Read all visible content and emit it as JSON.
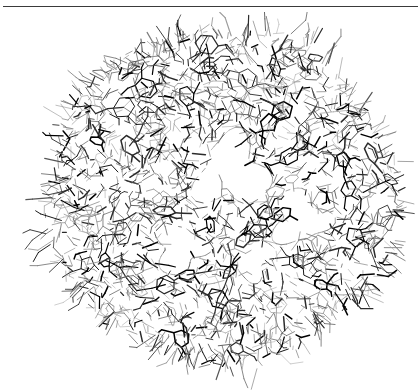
{
  "figure": {
    "panel_label": "(a)",
    "kind": "molecular-wireframe",
    "background_color": "#ffffff",
    "rule": {
      "present": true,
      "color": "#3a3a3a",
      "x": 3,
      "y": 6,
      "width": 415,
      "thickness": 1.1
    },
    "structure": {
      "center_x": 222,
      "center_y": 195,
      "radius_x": 180,
      "radius_y": 172,
      "bond_colors": [
        "#000000",
        "#2b2b2b",
        "#555555",
        "#7d7d7d",
        "#9c9c9c"
      ],
      "line_widths": [
        0.5,
        0.7,
        0.9,
        1.2,
        1.5
      ],
      "ring_count": 96,
      "cavities": [
        {
          "cx": 232,
          "cy": 172,
          "r": 34
        },
        {
          "cx": 300,
          "cy": 218,
          "r": 26
        },
        {
          "cx": 180,
          "cy": 248,
          "r": 24
        },
        {
          "cx": 252,
          "cy": 258,
          "r": 20
        },
        {
          "cx": 168,
          "cy": 168,
          "r": 15
        }
      ]
    }
  }
}
